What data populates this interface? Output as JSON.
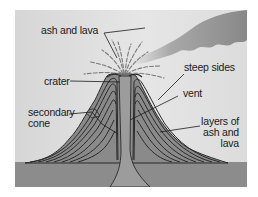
{
  "diagram": {
    "type": "volcano-cross-section",
    "colors": {
      "sky": "#dadada",
      "ash_cloud": "#8e8e8e",
      "cone_fill": "#8a8a8a",
      "layer_lines": "#2a2a2a",
      "vent": "#9a9a9a",
      "ground": "#8c8c8c",
      "label_text": "#1a1a1a"
    },
    "labels": {
      "ash_and_lava": "ash and lava",
      "crater": "crater",
      "steep_sides": "steep sides",
      "vent": "vent",
      "secondary_cone_line1": "secondary",
      "secondary_cone_line2": "cone",
      "layers_line1": "layers of",
      "layers_line2": "ash and",
      "layers_line3": "lava"
    }
  }
}
